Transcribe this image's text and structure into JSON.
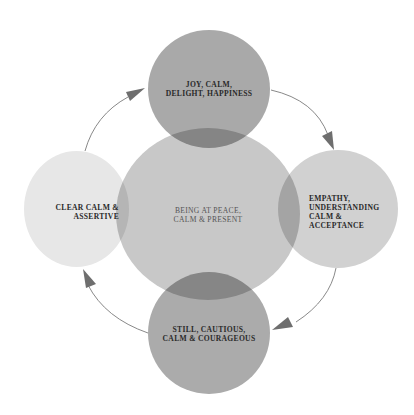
{
  "diagram": {
    "colors": {
      "top": "#a9a9a9",
      "center": "#c8c8c8",
      "left": "#e7e7e7",
      "right": "#d1d1d1",
      "bottom": "#ababab",
      "arrow": "#6e6e6e"
    },
    "nodes": {
      "center": {
        "label": "Being at peace,\ncalm & present"
      },
      "top": {
        "label": "Joy, calm,\ndelight, happiness"
      },
      "right": {
        "label": "Empathy,\nunderstanding\ncalm &\nacceptance"
      },
      "bottom": {
        "label": "Still, cautious,\ncalm & courageous"
      },
      "left": {
        "label": "Clear calm &\nassertive"
      }
    },
    "cycle": [
      "top",
      "right",
      "bottom",
      "left"
    ],
    "arrows": [
      {
        "from": "top",
        "to": "right",
        "direction": "clockwise"
      },
      {
        "from": "right",
        "to": "bottom",
        "direction": "clockwise"
      },
      {
        "from": "bottom",
        "to": "left",
        "direction": "clockwise"
      },
      {
        "from": "left",
        "to": "top",
        "direction": "clockwise"
      }
    ]
  }
}
